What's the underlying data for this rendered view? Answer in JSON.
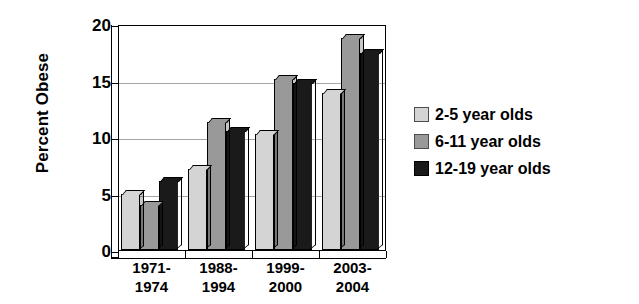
{
  "chart_data": {
    "type": "bar",
    "title": "",
    "subtitle": "",
    "xlabel": "",
    "ylabel": "Percent Obese",
    "categories": [
      "1971-\n1974",
      "1988-\n1994",
      "1999-\n2000",
      "2003-\n2004"
    ],
    "category_lines": [
      [
        "1971-",
        "1974"
      ],
      [
        "1988-",
        "1994"
      ],
      [
        "1999-",
        "2000"
      ],
      [
        "2003-",
        "2004"
      ]
    ],
    "series": [
      {
        "name": "2-5 year olds",
        "color": "#d4d4d4",
        "values": [
          5.0,
          7.2,
          10.3,
          13.9
        ]
      },
      {
        "name": "6-11 year olds",
        "color": "#999999",
        "values": [
          4.0,
          11.3,
          15.1,
          18.8
        ]
      },
      {
        "name": "12-19 year olds",
        "color": "#1a1a1a",
        "values": [
          6.1,
          10.5,
          14.8,
          17.4
        ]
      }
    ],
    "ylim": [
      0,
      20
    ],
    "yticks": [
      0,
      5,
      10,
      15,
      20
    ],
    "ytick_labels": [
      "0",
      "5",
      "10",
      "15",
      "20"
    ],
    "grid": true,
    "legend_position": "right",
    "style": "3d-bar"
  },
  "legend": {
    "items": [
      {
        "label": "2-5 year olds"
      },
      {
        "label": "6-11 year olds"
      },
      {
        "label": "12-19 year olds"
      }
    ]
  }
}
